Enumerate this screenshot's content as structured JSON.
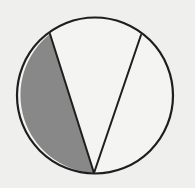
{
  "diagram": {
    "type": "circle-with-chords",
    "background": "#efefed",
    "circle": {
      "cx": 95,
      "cy": 95.5,
      "r": 78,
      "fill": "#f4f4f3",
      "stroke": "#1e1e1e",
      "stroke_width": 2.2
    },
    "points": {
      "A": {
        "x": 50,
        "y": 34
      },
      "B": {
        "x": 141,
        "y": 35
      },
      "C": {
        "x": 94,
        "y": 173
      }
    },
    "chords": [
      {
        "from": "A",
        "to": "C"
      },
      {
        "from": "B",
        "to": "C"
      }
    ],
    "shaded_segment": {
      "between": [
        "A",
        "C"
      ],
      "side": "left",
      "fill": "#888888"
    }
  }
}
